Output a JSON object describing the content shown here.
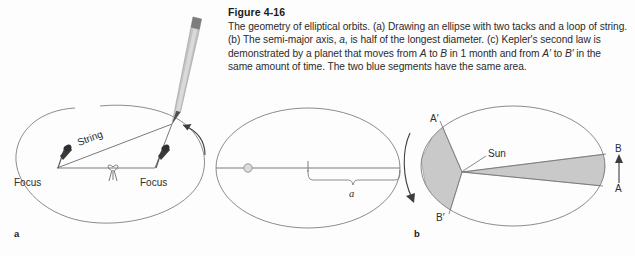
{
  "figure": {
    "number": "Figure 4-16",
    "caption_runs": [
      {
        "text": "The geometry of elliptical orbits. (a) Drawing an ellipse with two tacks and a loop of string. (b) The semi-major axis, ",
        "style": "normal"
      },
      {
        "text": "a",
        "style": "italic"
      },
      {
        "text": ", is half of the longest diameter. (c) Kepler's second law is demonstrated by a planet that moves from ",
        "style": "normal"
      },
      {
        "text": "A",
        "style": "italic"
      },
      {
        "text": " to ",
        "style": "normal"
      },
      {
        "text": "B",
        "style": "italic"
      },
      {
        "text": " in 1 month and from ",
        "style": "normal"
      },
      {
        "text": "A′",
        "style": "italic"
      },
      {
        "text": " to ",
        "style": "normal"
      },
      {
        "text": "B′",
        "style": "italic"
      },
      {
        "text": " in the same amount of time. The two blue segments have the same area.",
        "style": "normal"
      }
    ],
    "caption_plain": "The geometry of elliptical orbits. (a) Drawing an ellipse with two tacks and a loop of string. (b) The semi-major axis, a, is half of the longest diameter. (c) Kepler's second law is demonstrated by a planet that moves from A to B in 1 month and from A′ to B′ in the same amount of time. The two blue segments have the same area."
  },
  "colors": {
    "background": "#fdfdfd",
    "outline": "#6f6f6f",
    "sector_fill": "#c9c9c9",
    "sector_stroke": "#9a9a9a",
    "text": "#2b2b2b",
    "pencil_body": "#b9b9b9",
    "pencil_tip": "#4a4a4a",
    "tack": "#3a3a3a"
  },
  "panels": {
    "a": {
      "letter": "a",
      "title": "Drawing an ellipse with two tacks and a loop of string",
      "labels": {
        "focus_left": "Focus",
        "focus_right": "Focus",
        "string": "String"
      },
      "elements": [
        "ellipse-outline",
        "tack-left",
        "tack-right",
        "string-triangle",
        "knot",
        "pencil",
        "motion-arrow"
      ]
    },
    "b": {
      "letter": "b",
      "title": "The semi-major axis a is half of the longest diameter",
      "labels": {
        "semi_major_axis": "a"
      },
      "elements": [
        "ellipse-outline",
        "major-axis-line",
        "sun-marker",
        "brace",
        "axis-tick"
      ]
    },
    "c": {
      "letter": "c",
      "title": "Kepler's second law",
      "labels": {
        "sun": "Sun",
        "point_a": "A",
        "point_b": "B",
        "point_a_prime": "A′",
        "point_b_prime": "B′"
      },
      "elements": [
        "ellipse-outline",
        "sun-vertex",
        "sector-near",
        "sector-far",
        "orbit-direction-arrow",
        "ab-direction-arrow"
      ]
    }
  }
}
